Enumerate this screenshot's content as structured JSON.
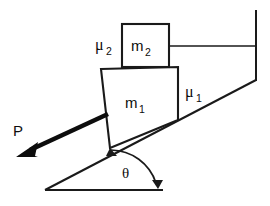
{
  "diagram": {
    "kind": "inclined-plane-friction-diagram",
    "background_color": "#ffffff",
    "ink_color": "#1a1a1a",
    "labels": {
      "block_lower": "m",
      "block_lower_sub": "1",
      "block_upper": "m",
      "block_upper_sub": "2",
      "friction_incline": "μ",
      "friction_incline_sub": "1",
      "friction_between_blocks": "μ",
      "friction_between_blocks_sub": "2",
      "applied_force": "P",
      "angle": "θ"
    },
    "elements": {
      "wall_name": "fixed-vertical-wall",
      "cord_name": "horizontal-cord",
      "incline_name": "incline-surface",
      "base_name": "horizontal-base-line",
      "angle_arc_name": "angle-arc",
      "force_arrow_name": "applied-force-arrow"
    }
  }
}
